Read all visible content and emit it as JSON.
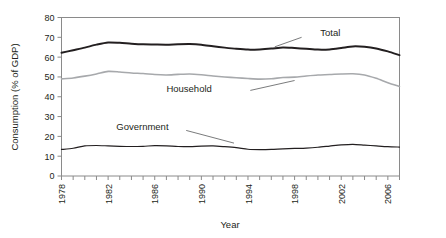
{
  "chart_data": {
    "type": "line",
    "title": "",
    "xlabel": "Year",
    "ylabel": "Consumption (% of GDP)",
    "xlim": [
      1978,
      2007
    ],
    "ylim": [
      0,
      80
    ],
    "ytick_step": 10,
    "yticks": [
      0,
      10,
      20,
      30,
      40,
      50,
      60,
      70,
      80
    ],
    "xticks": [
      1978,
      1979,
      1980,
      1981,
      1982,
      1983,
      1984,
      1985,
      1986,
      1987,
      1988,
      1989,
      1990,
      1991,
      1992,
      1993,
      1994,
      1995,
      1996,
      1997,
      1998,
      1999,
      2000,
      2001,
      2002,
      2003,
      2004,
      2005,
      2006,
      2007
    ],
    "xtick_labels": [
      "1978",
      "",
      "",
      "",
      "1982",
      "",
      "",
      "",
      "1986",
      "",
      "",
      "",
      "1990",
      "",
      "",
      "",
      "1994",
      "",
      "",
      "",
      "1998",
      "",
      "",
      "",
      "2002",
      "",
      "",
      "",
      "2006",
      ""
    ],
    "grid": false,
    "legend_position": "inline-annotations",
    "x": [
      1978,
      1979,
      1980,
      1981,
      1982,
      1983,
      1984,
      1985,
      1986,
      1987,
      1988,
      1989,
      1990,
      1991,
      1992,
      1993,
      1994,
      1995,
      1996,
      1997,
      1998,
      1999,
      2000,
      2001,
      2002,
      2003,
      2004,
      2005,
      2006,
      2007
    ],
    "series": [
      {
        "name": "Total",
        "color": "#231f20",
        "width": 2.0,
        "values": [
          62.2,
          63.5,
          64.8,
          66.3,
          67.4,
          67.2,
          66.8,
          66.5,
          66.4,
          66.3,
          66.5,
          66.6,
          66.3,
          65.5,
          64.8,
          64.2,
          63.8,
          63.9,
          64.3,
          64.9,
          64.6,
          64.2,
          63.8,
          63.9,
          64.6,
          65.4,
          65.2,
          64.4,
          62.9,
          61.0
        ],
        "label_text": "Total",
        "label_x": 2000,
        "label_y": 70.5
      },
      {
        "name": "Household",
        "color": "#a7a9ac",
        "width": 1.6,
        "values": [
          49.0,
          49.5,
          50.4,
          51.5,
          52.8,
          52.5,
          52.0,
          51.7,
          51.2,
          51.0,
          51.3,
          51.5,
          51.1,
          50.5,
          50.0,
          49.6,
          49.2,
          48.9,
          49.1,
          49.7,
          49.9,
          50.5,
          51.0,
          51.2,
          51.5,
          51.6,
          51.0,
          49.3,
          47.1,
          45.2
        ],
        "label_text": "Household",
        "label_x": 1991,
        "label_y": 43.0
      },
      {
        "name": "Government",
        "color": "#231f20",
        "width": 1.2,
        "values": [
          13.4,
          14.0,
          15.2,
          15.4,
          15.2,
          15.0,
          14.9,
          15.0,
          15.3,
          15.2,
          14.9,
          14.8,
          15.1,
          15.2,
          14.8,
          14.3,
          13.5,
          13.3,
          13.4,
          13.7,
          13.9,
          14.1,
          14.5,
          15.1,
          15.7,
          16.0,
          15.6,
          15.2,
          14.8,
          14.6
        ],
        "label_text": "Government",
        "label_x": 1986,
        "label_y": 22.5
      }
    ],
    "end_labels_right": {
      "total": 49.8,
      "household": 36.5,
      "government": 14.3
    }
  },
  "annotations": {
    "total_leader": "leader-line-total",
    "household_leader": "leader-line-household",
    "government_leader": "leader-line-government"
  }
}
